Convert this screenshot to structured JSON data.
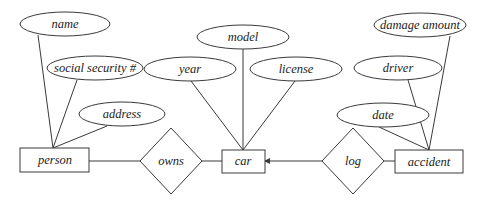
{
  "diagram": {
    "type": "entity-relationship",
    "entities": [
      {
        "id": "person",
        "label": "person"
      },
      {
        "id": "car",
        "label": "car"
      },
      {
        "id": "accident",
        "label": "accident"
      }
    ],
    "relationships": [
      {
        "id": "owns",
        "label": "owns",
        "connects": [
          "person",
          "car"
        ]
      },
      {
        "id": "log",
        "label": "log",
        "connects": [
          "car",
          "accident"
        ],
        "arrow_to": "car"
      }
    ],
    "attributes": [
      {
        "id": "name",
        "label": "name",
        "of": "person"
      },
      {
        "id": "ssn",
        "label": "social security #",
        "of": "person"
      },
      {
        "id": "address",
        "label": "address",
        "of": "person"
      },
      {
        "id": "year",
        "label": "year",
        "of": "car"
      },
      {
        "id": "model",
        "label": "model",
        "of": "car"
      },
      {
        "id": "license",
        "label": "license",
        "of": "car"
      },
      {
        "id": "date",
        "label": "date",
        "of": "accident"
      },
      {
        "id": "driver",
        "label": "driver",
        "of": "accident"
      },
      {
        "id": "damage",
        "label": "damage amount",
        "of": "accident"
      }
    ]
  },
  "labels": {
    "person": "person",
    "car": "car",
    "accident": "accident",
    "owns": "owns",
    "log": "log",
    "name": "name",
    "ssn": "social security #",
    "address": "address",
    "year": "year",
    "model": "model",
    "license": "license",
    "date": "date",
    "driver": "driver",
    "damage": "damage amount"
  },
  "colors": {
    "stroke": "#3a3a3a",
    "text": "#222222",
    "background": "#ffffff"
  }
}
